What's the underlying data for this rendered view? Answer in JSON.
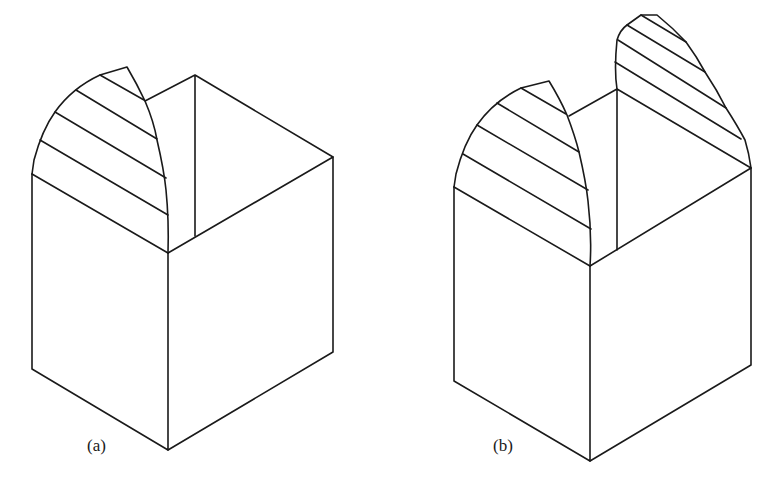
{
  "figures": [
    {
      "id": "a",
      "label": "(a)",
      "description": "Isometric cube with one hatched curved cut section rising above the left face"
    },
    {
      "id": "b",
      "label": "(b)",
      "description": "Isometric cube with two hatched curved cut sections rising above the left and right faces"
    }
  ],
  "colors": {
    "stroke": "#1a1a1a",
    "background": "#ffffff"
  }
}
